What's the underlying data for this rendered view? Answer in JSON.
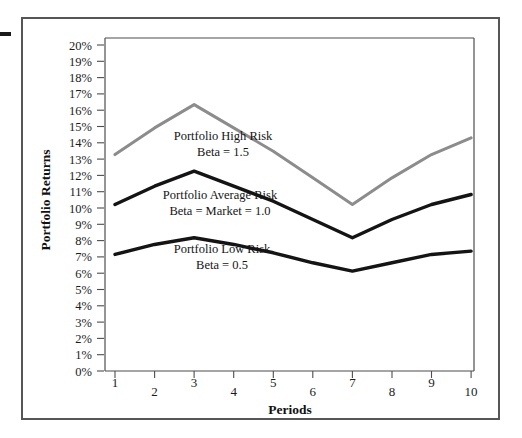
{
  "figure": {
    "background_color": "#ffffff",
    "frame_color": "#55565a",
    "edge_mark_color": "#1a1a1a"
  },
  "axes": {
    "y_title": "Portfolio Returns",
    "x_title": "Periods",
    "y_ticks": [
      "0%",
      "1%",
      "2%",
      "3%",
      "4%",
      "5%",
      "6%",
      "7%",
      "8%",
      "9%",
      "10%",
      "11%",
      "12%",
      "13%",
      "14%",
      "15%",
      "16%",
      "17%",
      "18%",
      "19%",
      "20%"
    ],
    "x_ticks": [
      "1",
      "2",
      "3",
      "4",
      "5",
      "6",
      "7",
      "8",
      "9",
      "10"
    ]
  },
  "annotations": {
    "high_risk_line1": "Portfolio High Risk",
    "high_risk_line2": "Beta = 1.5",
    "average_risk_line1": "Portfolio Average Risk",
    "average_risk_line2": "Beta = Market = 1.0",
    "low_risk_line1": "Portfolio Low Risk",
    "low_risk_line2": "Beta = 0.5"
  },
  "chart_data": {
    "type": "line",
    "title": "",
    "xlabel": "Periods",
    "ylabel": "Portfolio Returns",
    "x": [
      1,
      2,
      3,
      4,
      5,
      6,
      7,
      8,
      9,
      10
    ],
    "xlim": [
      1,
      10
    ],
    "ylim": [
      0,
      20
    ],
    "y_unit": "percent",
    "y_tick_step": 1,
    "grid": false,
    "legend": "inline-annotations",
    "series": [
      {
        "name": "Portfolio High Risk",
        "beta": 1.5,
        "color": "#8c8c8c",
        "stroke_width": 3.0,
        "values": [
          13.0,
          14.6,
          16.0,
          14.6,
          13.2,
          11.6,
          10.0,
          11.6,
          13.0,
          14.0
        ]
      },
      {
        "name": "Portfolio Average Risk",
        "beta": 1.0,
        "color": "#141414",
        "stroke_width": 3.4,
        "values": [
          10.0,
          11.1,
          12.0,
          11.1,
          10.2,
          9.1,
          8.0,
          9.1,
          10.0,
          10.6
        ]
      },
      {
        "name": "Portfolio Low Risk",
        "beta": 0.5,
        "color": "#141414",
        "stroke_width": 3.4,
        "values": [
          7.0,
          7.6,
          8.0,
          7.6,
          7.1,
          6.5,
          6.0,
          6.5,
          7.0,
          7.2
        ]
      }
    ]
  }
}
